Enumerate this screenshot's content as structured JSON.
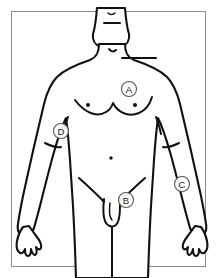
{
  "figure": {
    "view": "anterior (front) view",
    "background_color": "#ffffff",
    "frame": {
      "present": true,
      "border_color": "#8c8c8c",
      "left": 11,
      "top": 11,
      "width": 195,
      "height": 256
    },
    "line_color": "#111111",
    "label_circle_stroke": "#555555",
    "label_circle_fill": "#ffffff"
  },
  "labels": [
    {
      "id": "A",
      "letter": "A",
      "cx": 129,
      "cy": 89,
      "r": 7.5,
      "region": "left chest / pectoral, above nipple"
    },
    {
      "id": "B",
      "letter": "B",
      "cx": 126,
      "cy": 200,
      "r": 7.5,
      "region": "groin / genital area"
    },
    {
      "id": "C",
      "letter": "C",
      "cx": 182,
      "cy": 184,
      "r": 7.5,
      "region": "right forearm, below elbow"
    },
    {
      "id": "D",
      "letter": "D",
      "cx": 61,
      "cy": 131,
      "r": 7.5,
      "region": "left elbow / upper forearm"
    }
  ],
  "anatomical_marks": [
    {
      "name": "left-nipple",
      "cx": 88,
      "cy": 105,
      "r": 2.0
    },
    {
      "name": "right-nipple",
      "cx": 135,
      "cy": 105,
      "r": 2.0
    },
    {
      "name": "navel",
      "cx": 111,
      "cy": 158,
      "r": 1.7
    }
  ],
  "legend": {
    "visible": false,
    "items": []
  }
}
